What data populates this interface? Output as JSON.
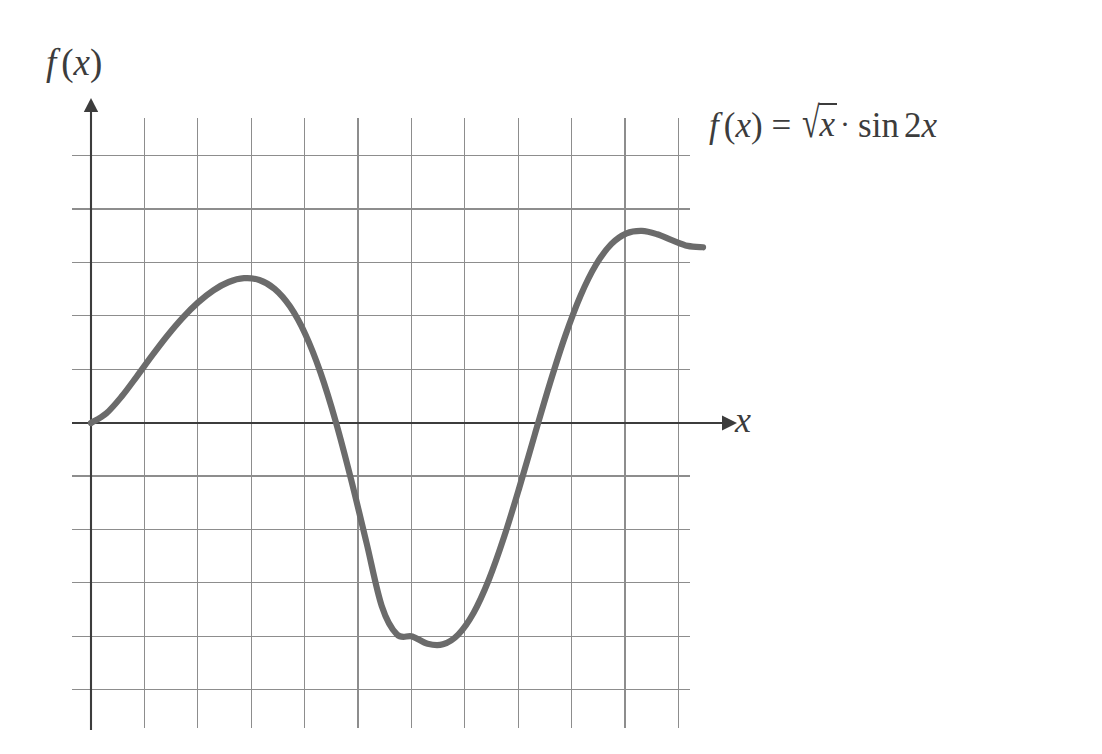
{
  "figure": {
    "background_color": "#ffffff",
    "axis_color": "#3c3c3c",
    "grid_color": "#8d8d8d",
    "curve_color": "#6b6b6b",
    "y_axis_label": "f(x)",
    "x_axis_label": "x",
    "equation_label": "f(x) = √x · sin 2x",
    "equation_parts": {
      "fn": "f",
      "open_paren": "(",
      "var": "x",
      "close_paren": ")",
      "equals": "=",
      "radical": "√",
      "radicand": "x",
      "dot": "·",
      "sin": "sin",
      "coefficient": "2",
      "arg": "x"
    }
  },
  "chart_data": {
    "type": "line",
    "title": "",
    "subtitle": "",
    "xlabel": "x",
    "ylabel": "f(x)",
    "function": "f(x) = sqrt(x) * sin(2x)",
    "annotations": [
      {
        "text": "f(x) = √x · sin 2x",
        "x": 4.0,
        "y": 1.73,
        "position": "curve-end-right"
      }
    ],
    "legend": {
      "entries": [],
      "position": "none"
    },
    "grid": true,
    "grid_spacing_x": 0.349,
    "grid_spacing_y": 0.349,
    "xlim": [
      0,
      4.0
    ],
    "ylim": [
      -1.57,
      1.9
    ],
    "axis_origin": [
      0,
      0
    ],
    "x": [
      0.0,
      0.1,
      0.2,
      0.3,
      0.4,
      0.5,
      0.6,
      0.7,
      0.8,
      0.9,
      1.0,
      1.1,
      1.2,
      1.3,
      1.4,
      1.5,
      1.6,
      1.7,
      1.8,
      1.9,
      2.0,
      2.1,
      2.2,
      2.3,
      2.4,
      2.5,
      2.6,
      2.7,
      2.8,
      2.9,
      3.0,
      3.1,
      3.2,
      3.3,
      3.4,
      3.5,
      3.6,
      3.7,
      3.8,
      3.9,
      4.0
    ],
    "y": [
      0.0,
      0.0628,
      0.1729,
      0.3053,
      0.4418,
      0.5718,
      0.6888,
      0.7884,
      0.8672,
      0.9215,
      0.9463,
      0.9345,
      0.8767,
      0.7624,
      0.5818,
      0.3293,
      0.0079,
      -0.3692,
      -0.7802,
      -1.1955,
      -1.382,
      -1.3951,
      -1.4429,
      -1.4464,
      -1.3826,
      -1.2414,
      -1.0243,
      -0.7438,
      -0.4199,
      -0.0767,
      0.2614,
      0.5711,
      0.8331,
      1.0341,
      1.1686,
      1.2391,
      1.2556,
      1.2338,
      1.1936,
      1.1575,
      1.1484
    ],
    "zero_crossings": [
      0.0,
      1.571,
      3.142
    ],
    "local_maximum": {
      "x": 0.93,
      "y": 0.95
    },
    "local_minimum": {
      "x": 2.28,
      "y": -1.45
    },
    "curve_start": {
      "x": 0.0,
      "y": 0.0
    },
    "curve_end": {
      "x": 4.0,
      "y": 1.73
    }
  }
}
